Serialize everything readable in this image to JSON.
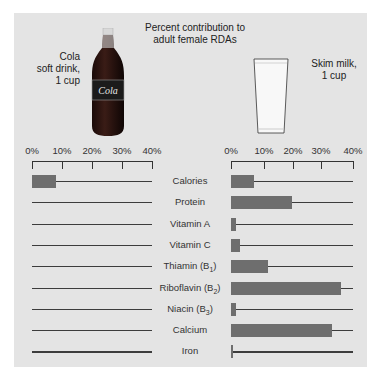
{
  "header": {
    "title_line1": "Percent contribution to",
    "title_line2": "adult female RDAs",
    "left_caption": [
      "Cola",
      "soft drink,",
      "1 cup"
    ],
    "right_caption": [
      "Skim milk,",
      "1 cup"
    ],
    "bottle_label": "Cola"
  },
  "axis": {
    "ticks": [
      "0%",
      "10%",
      "20%",
      "30%",
      "40%"
    ]
  },
  "rows": [
    {
      "label": "Calories",
      "cola": 8,
      "milk": 7.5
    },
    {
      "label": "Protein",
      "cola": 0,
      "milk": 20
    },
    {
      "label": "Vitamin A",
      "cola": 0,
      "milk": 1.5
    },
    {
      "label": "Vitamin C",
      "cola": 0,
      "milk": 3
    },
    {
      "label": "Thiamin (B1)",
      "cola": 0,
      "milk": 12
    },
    {
      "label": "Riboflavin (B2)",
      "cola": 0,
      "milk": 36
    },
    {
      "label": "Niacin (B3)",
      "cola": 0,
      "milk": 1.5
    },
    {
      "label": "Calcium",
      "cola": 0,
      "milk": 33
    },
    {
      "label": "Iron",
      "cola": 0,
      "milk": 0.5
    }
  ],
  "colors": {
    "bar": "#6e6e6e",
    "panel": "#e4e4e4",
    "line": "#3c3c3c"
  },
  "chart_data": {
    "type": "bar",
    "orientation": "horizontal",
    "title": "Percent contribution to adult female RDAs",
    "categories": [
      "Calories",
      "Protein",
      "Vitamin A",
      "Vitamin C",
      "Thiamin (B1)",
      "Riboflavin (B2)",
      "Niacin (B3)",
      "Calcium",
      "Iron"
    ],
    "series": [
      {
        "name": "Cola soft drink, 1 cup",
        "values": [
          8,
          0,
          0,
          0,
          0,
          0,
          0,
          0,
          0
        ]
      },
      {
        "name": "Skim milk, 1 cup",
        "values": [
          7.5,
          20,
          1.5,
          3,
          12,
          36,
          1.5,
          33,
          0.5
        ]
      }
    ],
    "xlabel": "",
    "ylabel": "",
    "xlim": [
      0,
      40
    ],
    "xticks": [
      "0%",
      "10%",
      "20%",
      "30%",
      "40%"
    ],
    "grid": false,
    "legend": "captions above each panel"
  }
}
